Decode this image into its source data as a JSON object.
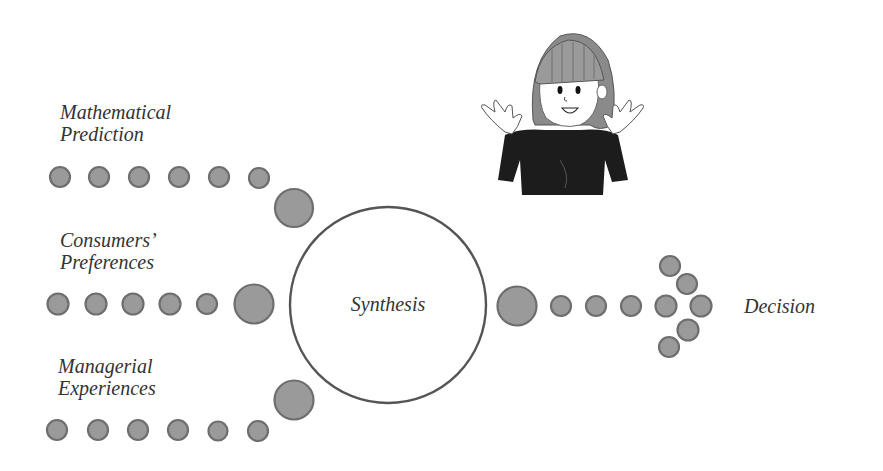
{
  "diagram": {
    "inputs": [
      {
        "line1": "Mathematical",
        "line2": "Prediction"
      },
      {
        "line1": "Consumers’",
        "line2": "Preferences"
      },
      {
        "line1": "Managerial",
        "line2": "Experiences"
      }
    ],
    "center": {
      "label": "Synthesis"
    },
    "output": {
      "label": "Decision"
    },
    "illustration": {
      "description": "cartoon girl with raised open hands"
    },
    "colors": {
      "dot_fill": "#9a9a9a",
      "dot_stroke": "#6e6e6e",
      "circle_stroke": "#555555",
      "text": "#333333"
    }
  }
}
